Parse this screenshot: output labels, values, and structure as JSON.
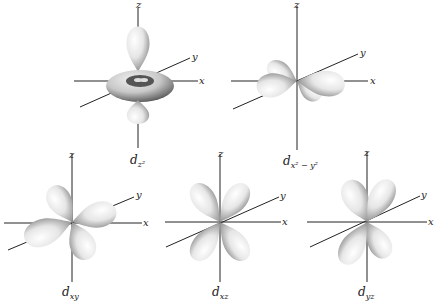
{
  "axis_labels": {
    "x": "x",
    "y": "y",
    "z": "z"
  },
  "orbitals": [
    {
      "id": "dz2",
      "symbol": "d",
      "subscript": "z²",
      "description": "two lobes along z axis with a torus in the xy plane"
    },
    {
      "id": "dx2-y2",
      "symbol": "d",
      "subscript": "x² − y²",
      "description": "four lobes along the x and y axes"
    },
    {
      "id": "dxy",
      "symbol": "d",
      "subscript": "xy",
      "description": "four lobes between the x and y axes"
    },
    {
      "id": "dxz",
      "symbol": "d",
      "subscript": "xz",
      "description": "four lobes between the x and z axes"
    },
    {
      "id": "dyz",
      "symbol": "d",
      "subscript": "yz",
      "description": "four lobes between the y and z axes"
    }
  ],
  "colors": {
    "axis": "#222222",
    "lobe_light": "#f4f4f4",
    "lobe_dark": "#3a3a3a",
    "background": "#ffffff"
  }
}
